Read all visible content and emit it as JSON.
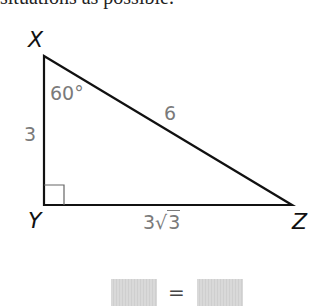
{
  "header": {
    "cutoff_text": "situations as possible."
  },
  "triangle": {
    "vertices": {
      "X": {
        "label": "X",
        "x": 44,
        "y": 56
      },
      "Y": {
        "label": "Y",
        "x": 44,
        "y": 205
      },
      "Z": {
        "label": "Z",
        "x": 292,
        "y": 205
      }
    },
    "angle_X": "60°",
    "side_XY": "3",
    "side_XZ": "6",
    "side_YZ": {
      "coefficient": "3",
      "radicand": "3"
    },
    "right_angle_at": "Y",
    "line_color": "#111111",
    "label_color": "#7a7a7a"
  },
  "equation": {
    "left_box": "",
    "operator": "=",
    "right_box": ""
  }
}
